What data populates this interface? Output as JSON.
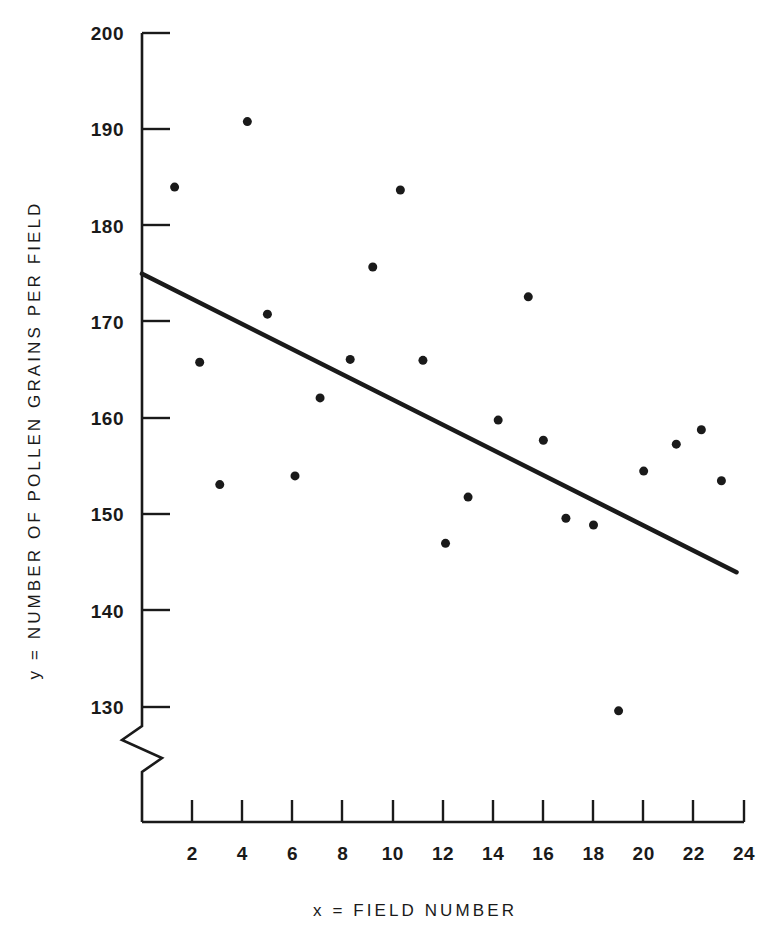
{
  "chart_data": {
    "type": "scatter",
    "title": "",
    "xlabel": "x = FIELD NUMBER",
    "ylabel": "y = NUMBER OF POLLEN GRAINS PER FIELD",
    "xlim": [
      0,
      24
    ],
    "ylim": [
      125,
      200
    ],
    "grid": false,
    "legend": null,
    "axis_break": {
      "axis": "y",
      "symbol": "zigzag",
      "below": 130
    },
    "xticks": [
      2,
      4,
      6,
      8,
      10,
      12,
      14,
      16,
      18,
      20,
      22,
      24
    ],
    "yticks": [
      130,
      140,
      150,
      160,
      170,
      180,
      190,
      200
    ],
    "x": [
      1.3,
      2.3,
      3.1,
      4.2,
      5.0,
      6.1,
      7.1,
      8.2,
      8.3,
      9.2,
      10.3,
      11.2,
      12.1,
      13.0,
      14.2,
      15.4,
      16.0,
      16.9,
      18.0,
      19.0,
      20.0,
      21.3,
      22.3,
      23.1
    ],
    "y": [
      184.0,
      165.8,
      153.1,
      190.8,
      170.8,
      154.0,
      162.1,
      166.1,
      166.1,
      175.7,
      183.7,
      166.0,
      147.0,
      151.8,
      159.8,
      172.6,
      157.7,
      149.6,
      148.9,
      129.6,
      154.5,
      157.3,
      158.8,
      153.5
    ],
    "points": [
      {
        "x": 1.3,
        "y": 184.0
      },
      {
        "x": 2.3,
        "y": 165.8
      },
      {
        "x": 3.1,
        "y": 153.1
      },
      {
        "x": 4.2,
        "y": 190.8
      },
      {
        "x": 5.0,
        "y": 170.8
      },
      {
        "x": 6.1,
        "y": 154.0
      },
      {
        "x": 7.1,
        "y": 162.1
      },
      {
        "x": 8.3,
        "y": 166.1
      },
      {
        "x": 9.2,
        "y": 175.7
      },
      {
        "x": 10.3,
        "y": 183.7
      },
      {
        "x": 11.2,
        "y": 166.0
      },
      {
        "x": 12.1,
        "y": 147.0
      },
      {
        "x": 13.0,
        "y": 151.8
      },
      {
        "x": 14.2,
        "y": 159.8
      },
      {
        "x": 15.4,
        "y": 172.6
      },
      {
        "x": 16.0,
        "y": 157.7
      },
      {
        "x": 16.9,
        "y": 149.6
      },
      {
        "x": 18.0,
        "y": 148.9
      },
      {
        "x": 19.0,
        "y": 129.6
      },
      {
        "x": 20.0,
        "y": 154.5
      },
      {
        "x": 21.3,
        "y": 157.3
      },
      {
        "x": 22.3,
        "y": 158.8
      },
      {
        "x": 23.1,
        "y": 153.5
      }
    ],
    "fit_line": {
      "kind": "linear-regression",
      "x_start": 0.0,
      "y_start": 175.0,
      "x_end": 23.7,
      "y_end": 144.0
    },
    "marker": {
      "shape": "circle",
      "color": "#1a1a1a",
      "size_px": 9
    },
    "line_color": "#1a1a1a",
    "axis_color": "#1a1a1a",
    "background": "#ffffff"
  }
}
